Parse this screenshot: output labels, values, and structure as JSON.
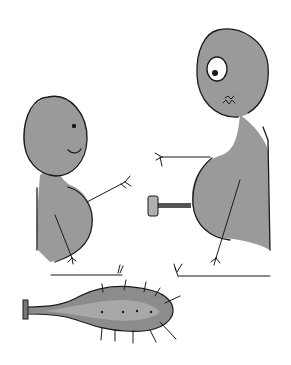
{
  "illustration": {
    "description": "Hand-drawn cartoon: a small round-headed figure on the left and a tall figure on the right reaching toward each other; a small hammer/mallet between them; a spiked club lying below.",
    "colors": {
      "background": "#ffffff",
      "ink": "#1a1a1a",
      "figure_fill": "#9a9a9a",
      "club_fill": "#8c8c8c",
      "club_highlight": "#a8a8a8"
    },
    "figures": [
      {
        "name": "small-figure",
        "position": "left",
        "expression": "smile"
      },
      {
        "name": "tall-figure",
        "position": "right",
        "expression": "wide eye, wavy mouth"
      }
    ],
    "objects": [
      {
        "name": "mallet",
        "position": "center"
      },
      {
        "name": "spiked-club",
        "position": "bottom-left"
      }
    ]
  }
}
